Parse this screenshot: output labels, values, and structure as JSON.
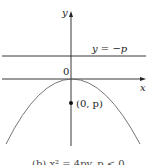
{
  "diagram": {
    "y_axis_label": "y",
    "x_axis_label": "x",
    "origin_label": "0",
    "directrix_label": "y = −p",
    "focus_label": "(0, p)",
    "caption": "(b) x² = 4py, p < 0",
    "colors": {
      "line": "#222222",
      "curve": "#666666"
    }
  }
}
